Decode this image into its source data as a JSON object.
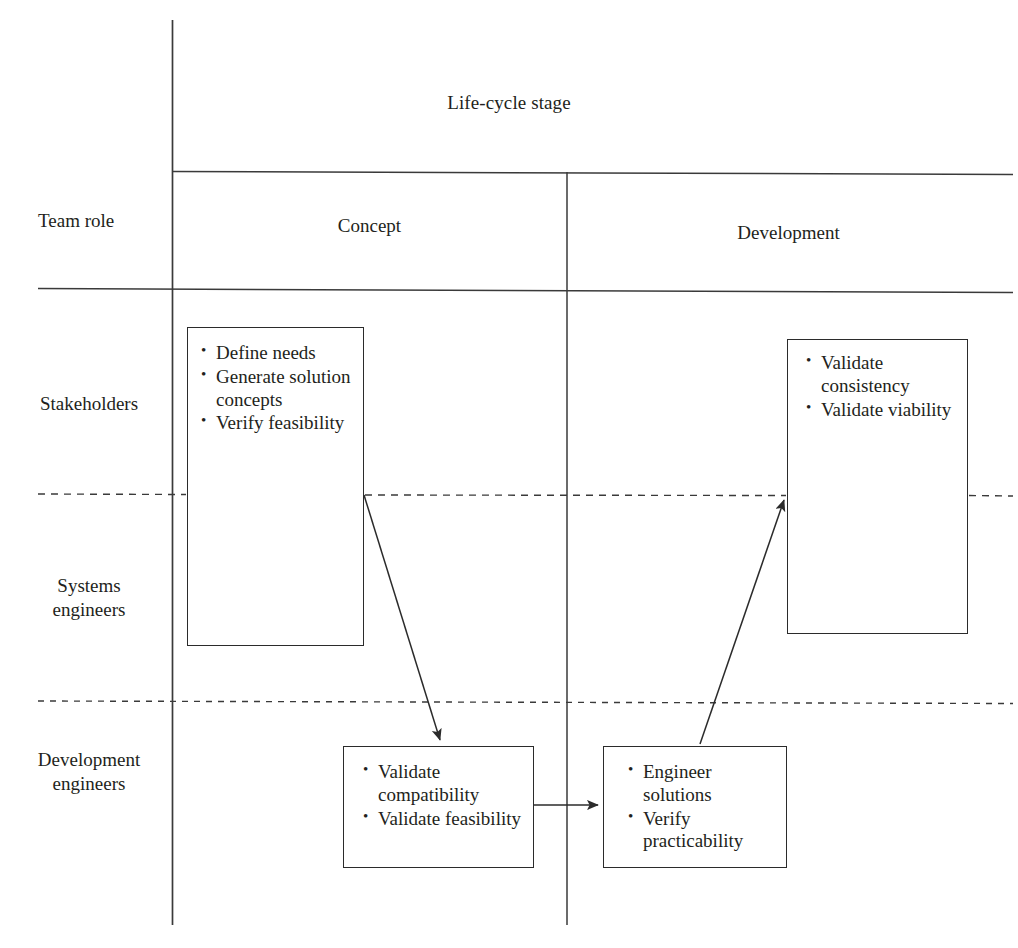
{
  "figure": {
    "axis_titles": {
      "columns_axis": "Life-cycle stage",
      "rows_axis": "Team role"
    },
    "columns": [
      {
        "id": "concept",
        "label": "Concept"
      },
      {
        "id": "development",
        "label": "Development"
      }
    ],
    "rows": [
      {
        "id": "stakeholders",
        "label": "Stakeholders"
      },
      {
        "id": "systems-engineers",
        "label": "Systems\nengineers"
      },
      {
        "id": "development-engineers",
        "label": "Development\nengineers"
      }
    ],
    "boxes": [
      {
        "id": "stakeholder-concept",
        "row": "stakeholders",
        "column": "concept",
        "items": [
          "Define needs",
          "Generate solution concepts",
          "Verify feasibility"
        ]
      },
      {
        "id": "stakeholder-development",
        "row": "stakeholders",
        "column": "development",
        "items": [
          "Validate consistency",
          "Validate viability"
        ]
      },
      {
        "id": "dev-concept",
        "row": "development-engineers",
        "column": "concept",
        "items": [
          "Validate compatibility",
          "Validate feasibility"
        ]
      },
      {
        "id": "dev-development",
        "row": "development-engineers",
        "column": "development",
        "items": [
          "Engineer solutions",
          "Verify practicability"
        ]
      }
    ],
    "arrows": [
      {
        "id": "concept-to-dev-concept",
        "from": "stakeholder-concept",
        "to": "dev-concept",
        "style": "solid"
      },
      {
        "id": "dev-concept-to-dev-development",
        "from": "dev-concept",
        "to": "dev-development",
        "style": "solid"
      },
      {
        "id": "dev-development-to-stakeholder-development",
        "from": "dev-development",
        "to": "stakeholder-development",
        "style": "solid"
      }
    ],
    "colors": {
      "line": "#3a3a3a",
      "box_border": "#2b2b2b",
      "text": "#231f20",
      "background": "#ffffff"
    }
  }
}
